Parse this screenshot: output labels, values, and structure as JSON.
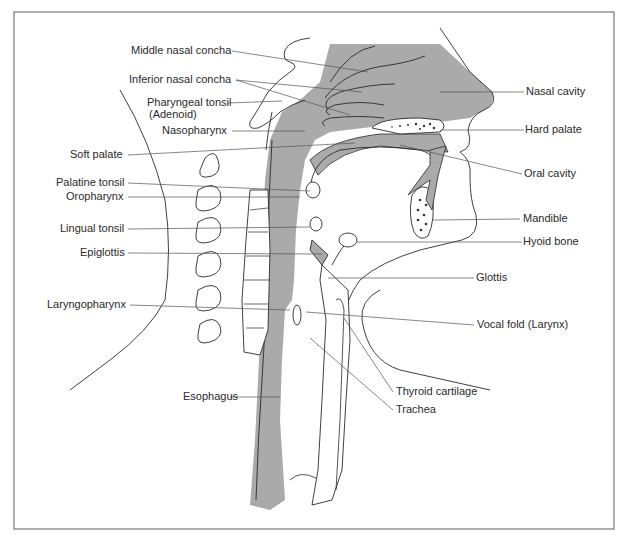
{
  "figure": {
    "colors": {
      "fill": "#aaaaaa",
      "line": "#2a2a2a",
      "leader": "#555555",
      "frame": "#777777",
      "background": "#ffffff"
    }
  },
  "labels": {
    "left": [
      {
        "id": "middle-nasal-concha",
        "text": "Middle nasal concha"
      },
      {
        "id": "inferior-nasal-concha",
        "text": "Inferior nasal concha"
      },
      {
        "id": "pharyngeal-tonsil",
        "text": "Pharyngeal tonsil"
      },
      {
        "id": "adenoid",
        "text": "(Adenoid)"
      },
      {
        "id": "nasopharynx",
        "text": "Nasopharynx"
      },
      {
        "id": "soft-palate",
        "text": "Soft palate"
      },
      {
        "id": "palatine-tonsil",
        "text": "Palatine tonsil"
      },
      {
        "id": "oropharynx",
        "text": "Oropharynx"
      },
      {
        "id": "lingual-tonsil",
        "text": "Lingual tonsil"
      },
      {
        "id": "epiglottis",
        "text": "Epiglottis"
      },
      {
        "id": "laryngopharynx",
        "text": "Laryngopharynx"
      },
      {
        "id": "esophagus",
        "text": "Esophagus"
      }
    ],
    "right": [
      {
        "id": "nasal-cavity",
        "text": "Nasal cavity"
      },
      {
        "id": "hard-palate",
        "text": "Hard palate"
      },
      {
        "id": "oral-cavity",
        "text": "Oral cavity"
      },
      {
        "id": "mandible",
        "text": "Mandible"
      },
      {
        "id": "hyoid-bone",
        "text": "Hyoid bone"
      },
      {
        "id": "glottis",
        "text": "Glottis"
      },
      {
        "id": "vocal-fold",
        "text": "Vocal fold (Larynx)"
      },
      {
        "id": "thyroid-cartilage",
        "text": "Thyroid cartilage"
      },
      {
        "id": "trachea",
        "text": "Trachea"
      }
    ]
  }
}
